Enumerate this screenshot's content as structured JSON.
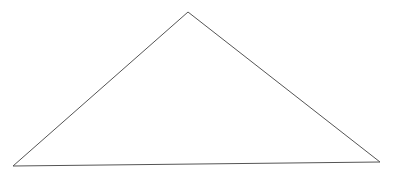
{
  "diagram": {
    "shape": "triangle",
    "stroke_color": "#555555",
    "fill_color": "none",
    "stroke_width": 1,
    "vertices": [
      {
        "name": "apex",
        "x": 188,
        "y": 12
      },
      {
        "name": "bottom-left",
        "x": 13,
        "y": 166
      },
      {
        "name": "bottom-right",
        "x": 380,
        "y": 162
      }
    ]
  }
}
